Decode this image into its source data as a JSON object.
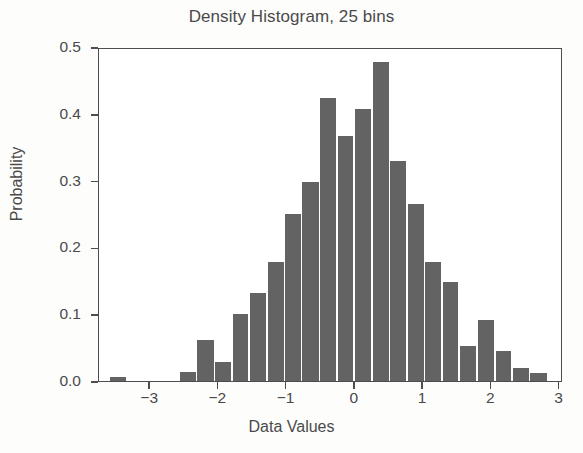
{
  "chart_data": {
    "type": "bar",
    "title": "Density Histogram, 25 bins",
    "xlabel": "Data Values",
    "ylabel": "Probability",
    "bins": 25,
    "grid": false,
    "legend": null,
    "xlim": [
      -3.75,
      3.05
    ],
    "ylim": [
      0.0,
      0.5
    ],
    "bar_color": "#636363",
    "axis_color": "#4d4d4d",
    "text_color": "#4a4a4a",
    "background": "#ffffff",
    "bin_width": 0.256,
    "xticks": [
      -3,
      -2,
      -1,
      0,
      1,
      2,
      3
    ],
    "xtick_labels": [
      "−3",
      "−2",
      "−1",
      "0",
      "1",
      "2",
      "3"
    ],
    "yticks": [
      0.0,
      0.1,
      0.2,
      0.3,
      0.4,
      0.5
    ],
    "ytick_labels": [
      "0.0",
      "0.1",
      "0.2",
      "0.3",
      "0.4",
      "0.5"
    ],
    "bin_centers": [
      -3.47,
      -3.22,
      -2.96,
      -2.7,
      -2.45,
      -2.19,
      -1.93,
      -1.68,
      -1.42,
      -1.16,
      -0.91,
      -0.65,
      -0.39,
      -0.14,
      0.12,
      0.38,
      0.63,
      0.89,
      1.15,
      1.4,
      1.66,
      1.92,
      2.17,
      2.43,
      2.69
    ],
    "bin_edges": [
      -3.6,
      -3.34,
      -3.09,
      -2.83,
      -2.57,
      -2.32,
      -2.06,
      -1.8,
      -1.55,
      -1.29,
      -1.03,
      -0.78,
      -0.52,
      -0.26,
      -0.01,
      0.25,
      0.51,
      0.76,
      1.02,
      1.28,
      1.53,
      1.79,
      2.05,
      2.3,
      2.56,
      2.82
    ],
    "categories": [
      "-3.47",
      "-3.22",
      "-2.96",
      "-2.70",
      "-2.45",
      "-2.19",
      "-1.93",
      "-1.68",
      "-1.42",
      "-1.16",
      "-0.91",
      "-0.65",
      "-0.39",
      "-0.14",
      "0.12",
      "0.38",
      "0.63",
      "0.89",
      "1.15",
      "1.40",
      "1.66",
      "1.92",
      "2.17",
      "2.43",
      "2.69"
    ],
    "values": [
      0.006,
      0.0,
      0.0,
      0.0,
      0.013,
      0.061,
      0.029,
      0.1,
      0.132,
      0.178,
      0.25,
      0.298,
      0.423,
      0.367,
      0.407,
      0.478,
      0.329,
      0.265,
      0.178,
      0.148,
      0.052,
      0.091,
      0.045,
      0.02,
      0.012
    ]
  }
}
